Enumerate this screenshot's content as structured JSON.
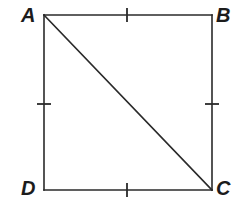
{
  "figure": {
    "kind": "geometry-diagram",
    "background_color": "#ffffff",
    "stroke_color": "#2a2a2a",
    "label_color": "#1c1c1c",
    "stroke_width": 1.6,
    "tick_stroke_width": 1.8
  },
  "labels": {
    "a": "A",
    "b": "B",
    "c": "C",
    "d": "D"
  },
  "vertices": {
    "A": {
      "x": 44,
      "y": 15
    },
    "B": {
      "x": 212,
      "y": 15
    },
    "C": {
      "x": 212,
      "y": 190
    },
    "D": {
      "x": 44,
      "y": 190
    }
  },
  "segments": [
    {
      "name": "side-AB",
      "x1": 44,
      "y1": 15,
      "x2": 212,
      "y2": 15
    },
    {
      "name": "side-BC",
      "x1": 212,
      "y1": 15,
      "x2": 212,
      "y2": 190
    },
    {
      "name": "side-CD",
      "x1": 212,
      "y1": 190,
      "x2": 44,
      "y2": 190
    },
    {
      "name": "side-DA",
      "x1": 44,
      "y1": 190,
      "x2": 44,
      "y2": 15
    },
    {
      "name": "diagonal-AC",
      "x1": 44,
      "y1": 15,
      "x2": 212,
      "y2": 190
    }
  ],
  "tick_marks": [
    {
      "name": "tick-AB",
      "x1": 127,
      "y1": 8,
      "x2": 127,
      "y2": 22
    },
    {
      "name": "tick-BC",
      "x1": 205,
      "y1": 104,
      "x2": 219,
      "y2": 104
    },
    {
      "name": "tick-CD",
      "x1": 127,
      "y1": 183,
      "x2": 127,
      "y2": 197
    },
    {
      "name": "tick-DA",
      "x1": 37,
      "y1": 104,
      "x2": 51,
      "y2": 104
    }
  ]
}
